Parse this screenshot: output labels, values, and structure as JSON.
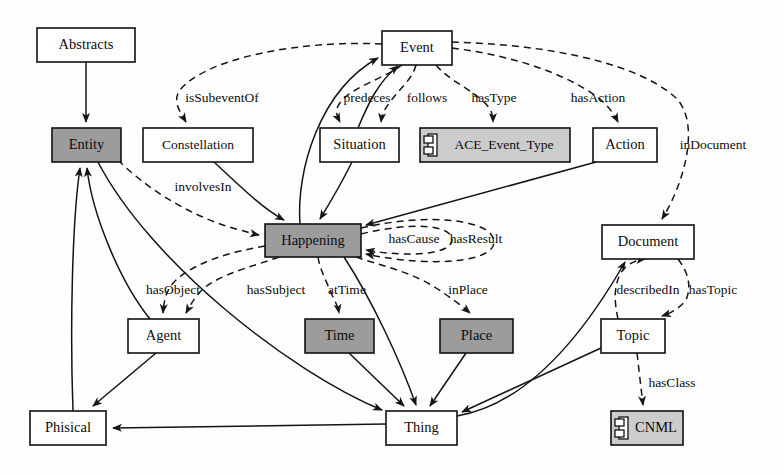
{
  "diagram": {
    "colors": {
      "shaded_fill": "#9c9c9c",
      "light_shaded_fill": "#cccccc",
      "plain_fill": "#ffffff",
      "stroke": "#141414"
    },
    "nodes": [
      {
        "id": "abstracts",
        "label": "Abstracts",
        "x": 37,
        "y": 28,
        "w": 98,
        "h": 34,
        "style": "plain"
      },
      {
        "id": "event",
        "label": "Event",
        "x": 382,
        "y": 31,
        "w": 70,
        "h": 34,
        "style": "plain"
      },
      {
        "id": "entity",
        "label": "Entity",
        "x": 52,
        "y": 128,
        "w": 69,
        "h": 34,
        "style": "shaded"
      },
      {
        "id": "constellation",
        "label": "Constellation",
        "x": 143,
        "y": 128,
        "w": 110,
        "h": 34,
        "style": "plain"
      },
      {
        "id": "situation",
        "label": "Situation",
        "x": 320,
        "y": 128,
        "w": 79,
        "h": 34,
        "style": "plain"
      },
      {
        "id": "ace",
        "label": "ACE_Event_Type",
        "x": 420,
        "y": 128,
        "w": 150,
        "h": 34,
        "style": "component"
      },
      {
        "id": "action",
        "label": "Action",
        "x": 593,
        "y": 128,
        "w": 64,
        "h": 34,
        "style": "plain"
      },
      {
        "id": "happening",
        "label": "Happening",
        "x": 265,
        "y": 224,
        "w": 96,
        "h": 33,
        "style": "shaded"
      },
      {
        "id": "document",
        "label": "Document",
        "x": 602,
        "y": 225,
        "w": 92,
        "h": 34,
        "style": "plain"
      },
      {
        "id": "agent",
        "label": "Agent",
        "x": 128,
        "y": 319,
        "w": 71,
        "h": 34,
        "style": "plain"
      },
      {
        "id": "time",
        "label": "Time",
        "x": 305,
        "y": 319,
        "w": 69,
        "h": 34,
        "style": "shaded"
      },
      {
        "id": "place",
        "label": "Place",
        "x": 440,
        "y": 319,
        "w": 73,
        "h": 34,
        "style": "shaded"
      },
      {
        "id": "topic",
        "label": "Topic",
        "x": 601,
        "y": 319,
        "w": 64,
        "h": 34,
        "style": "plain"
      },
      {
        "id": "phisical",
        "label": "Phisical",
        "x": 30,
        "y": 411,
        "w": 76,
        "h": 34,
        "style": "plain"
      },
      {
        "id": "thing",
        "label": "Thing",
        "x": 386,
        "y": 411,
        "w": 71,
        "h": 34,
        "style": "plain"
      },
      {
        "id": "cnml",
        "label": "CNML",
        "x": 611,
        "y": 411,
        "w": 72,
        "h": 34,
        "style": "component"
      }
    ],
    "edge_labels": [
      {
        "id": "isSubeventOf",
        "text": "isSubeventOf",
        "x": 222,
        "y": 99
      },
      {
        "id": "predeces",
        "text": "predeces",
        "x": 367,
        "y": 99
      },
      {
        "id": "follows",
        "text": "follows",
        "x": 427,
        "y": 99
      },
      {
        "id": "hasType",
        "text": "hasType",
        "x": 494,
        "y": 99
      },
      {
        "id": "hasAction",
        "text": "hasAction",
        "x": 598,
        "y": 99
      },
      {
        "id": "inDocument",
        "text": "inDocument",
        "x": 713,
        "y": 146
      },
      {
        "id": "involvesIn",
        "text": "involvesIn",
        "x": 203,
        "y": 188
      },
      {
        "id": "hasCause",
        "text": "hasCause",
        "x": 414,
        "y": 240
      },
      {
        "id": "hasResult",
        "text": "hasResult",
        "x": 476,
        "y": 240
      },
      {
        "id": "hasObject",
        "text": "hasObject",
        "x": 173,
        "y": 291
      },
      {
        "id": "hasSubject",
        "text": "hasSubject",
        "x": 276,
        "y": 291
      },
      {
        "id": "atTime",
        "text": "atTime",
        "x": 347,
        "y": 291
      },
      {
        "id": "inPlace",
        "text": "inPlace",
        "x": 468,
        "y": 291
      },
      {
        "id": "describedIn",
        "text": "describedIn",
        "x": 648,
        "y": 291
      },
      {
        "id": "hasTopic",
        "text": "hasTopic",
        "x": 713,
        "y": 291
      },
      {
        "id": "hasClass",
        "text": "hasClass",
        "x": 672,
        "y": 384
      }
    ],
    "edges": [
      {
        "id": "abstracts-entity",
        "from": "Abstracts",
        "to": "Entity",
        "kind": "solid"
      },
      {
        "id": "happening-event",
        "from": "Happening",
        "to": "Event",
        "kind": "solid"
      },
      {
        "id": "situation-event",
        "from": "Situation",
        "to": "Event",
        "kind": "solid"
      },
      {
        "id": "constellation-happening",
        "from": "Constellation",
        "to": "Happening",
        "kind": "solid"
      },
      {
        "id": "situation-happening",
        "from": "Situation",
        "to": "Happening",
        "kind": "solid"
      },
      {
        "id": "action-happening",
        "from": "Action",
        "to": "Happening",
        "kind": "solid"
      },
      {
        "id": "event-isSubeventOf",
        "from": "Event",
        "to": "Constellation",
        "kind": "dashed"
      },
      {
        "id": "event-predeces",
        "from": "Event",
        "to": "Situation",
        "kind": "dashed"
      },
      {
        "id": "event-follows",
        "from": "Event",
        "to": "Situation",
        "kind": "dashed"
      },
      {
        "id": "event-hasType",
        "from": "Event",
        "to": "ACE_Event_Type",
        "kind": "dashed"
      },
      {
        "id": "event-hasAction",
        "from": "Event",
        "to": "Action",
        "kind": "dashed"
      },
      {
        "id": "event-inDocument",
        "from": "Event",
        "to": "Document",
        "kind": "dashed"
      },
      {
        "id": "entity-involvesIn",
        "from": "Entity",
        "to": "Happening",
        "kind": "dashed"
      },
      {
        "id": "happening-hasCause",
        "from": "Happening",
        "to": "Happening",
        "kind": "dashed"
      },
      {
        "id": "happening-hasResult",
        "from": "Happening",
        "to": "Happening",
        "kind": "dashed"
      },
      {
        "id": "happening-hasObject",
        "from": "Happening",
        "to": "Agent",
        "kind": "dashed"
      },
      {
        "id": "happening-hasSubject",
        "from": "Happening",
        "to": "Agent",
        "kind": "dashed"
      },
      {
        "id": "happening-atTime",
        "from": "Happening",
        "to": "Time",
        "kind": "dashed"
      },
      {
        "id": "happening-inPlace",
        "from": "Happening",
        "to": "Place",
        "kind": "dashed"
      },
      {
        "id": "topic-describedIn",
        "from": "Topic",
        "to": "Document",
        "kind": "dashed"
      },
      {
        "id": "document-hasTopic",
        "from": "Document",
        "to": "Topic",
        "kind": "dashed"
      },
      {
        "id": "topic-hasClass",
        "from": "Topic",
        "to": "CNML",
        "kind": "dashed"
      },
      {
        "id": "agent-entity",
        "from": "Agent",
        "to": "Entity",
        "kind": "solid"
      },
      {
        "id": "phisical-entity",
        "from": "Phisical",
        "to": "Entity",
        "kind": "solid"
      },
      {
        "id": "agent-phisical",
        "from": "Agent",
        "to": "Phisical",
        "kind": "solid"
      },
      {
        "id": "time-thing",
        "from": "Time",
        "to": "Thing",
        "kind": "solid"
      },
      {
        "id": "place-thing",
        "from": "Place",
        "to": "Thing",
        "kind": "solid"
      },
      {
        "id": "happening-thing",
        "from": "Happening",
        "to": "Thing",
        "kind": "solid"
      },
      {
        "id": "topic-thing",
        "from": "Topic",
        "to": "Thing",
        "kind": "solid"
      },
      {
        "id": "entity-thing",
        "from": "Entity",
        "to": "Thing",
        "kind": "solid"
      },
      {
        "id": "thing-phisical",
        "from": "Thing",
        "to": "Phisical",
        "kind": "solid"
      },
      {
        "id": "thing-document",
        "from": "Thing",
        "to": "Document",
        "kind": "solid"
      }
    ]
  }
}
